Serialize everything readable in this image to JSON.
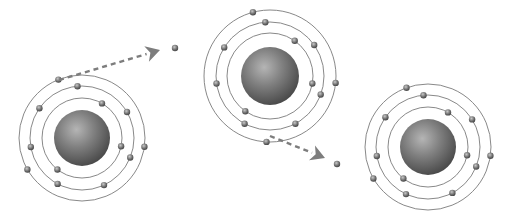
{
  "diagram": {
    "colors": {
      "background": "#ffffff",
      "orbit": "#7a7a7a",
      "nucleus_light": "#b0b0b0",
      "nucleus_mid": "#7c7c7c",
      "nucleus_dark": "#4a4a4a",
      "electron": "#6a6a6a",
      "arrow": "#7d7d7d"
    },
    "atoms": [
      {
        "id": "atom-left",
        "cx": 82,
        "cy": 138,
        "nucleus_r": 28,
        "shells": [
          40,
          52,
          63
        ],
        "electrons": [
          {
            "shell": 0,
            "angle": 12
          },
          {
            "shell": 0,
            "angle": 128
          },
          {
            "shell": 0,
            "angle": -60
          },
          {
            "shell": 1,
            "angle": -95
          },
          {
            "shell": 1,
            "angle": -30
          },
          {
            "shell": 1,
            "angle": 22
          },
          {
            "shell": 1,
            "angle": 65
          },
          {
            "shell": 1,
            "angle": 118
          },
          {
            "shell": 1,
            "angle": 170
          },
          {
            "shell": 1,
            "angle": -145
          },
          {
            "shell": 2,
            "angle": -112
          },
          {
            "shell": 2,
            "angle": 8
          },
          {
            "shell": 2,
            "angle": 150
          }
        ]
      },
      {
        "id": "atom-middle",
        "cx": 270,
        "cy": 76,
        "nucleus_r": 29,
        "shells": [
          43,
          54,
          66
        ],
        "electrons": [
          {
            "shell": 0,
            "angle": 10
          },
          {
            "shell": 0,
            "angle": 125
          },
          {
            "shell": 0,
            "angle": -55
          },
          {
            "shell": 1,
            "angle": -95
          },
          {
            "shell": 1,
            "angle": -35
          },
          {
            "shell": 1,
            "angle": 20
          },
          {
            "shell": 1,
            "angle": 62
          },
          {
            "shell": 1,
            "angle": 118
          },
          {
            "shell": 1,
            "angle": 172
          },
          {
            "shell": 1,
            "angle": -148
          },
          {
            "shell": 2,
            "angle": -105
          },
          {
            "shell": 2,
            "angle": 6
          },
          {
            "shell": 2,
            "angle": 93
          }
        ]
      },
      {
        "id": "atom-right",
        "cx": 428,
        "cy": 147,
        "nucleus_r": 28,
        "shells": [
          40,
          52,
          63
        ],
        "electrons": [
          {
            "shell": 0,
            "angle": 12
          },
          {
            "shell": 0,
            "angle": 128
          },
          {
            "shell": 0,
            "angle": -60
          },
          {
            "shell": 1,
            "angle": -95
          },
          {
            "shell": 1,
            "angle": -32
          },
          {
            "shell": 1,
            "angle": 22
          },
          {
            "shell": 1,
            "angle": 62
          },
          {
            "shell": 1,
            "angle": 115
          },
          {
            "shell": 1,
            "angle": 170
          },
          {
            "shell": 1,
            "angle": -145
          },
          {
            "shell": 2,
            "angle": -110
          },
          {
            "shell": 2,
            "angle": 8
          },
          {
            "shell": 2,
            "angle": 150
          }
        ]
      }
    ],
    "transfers": [
      {
        "id": "electron-transfer-1",
        "from": [
          59,
          80
        ],
        "to": [
          160,
          50
        ],
        "free_electron": [
          175,
          48
        ]
      },
      {
        "id": "electron-transfer-2",
        "from": [
          270,
          136
        ],
        "to": [
          325,
          158
        ],
        "free_electron": [
          337,
          164
        ]
      }
    ]
  }
}
